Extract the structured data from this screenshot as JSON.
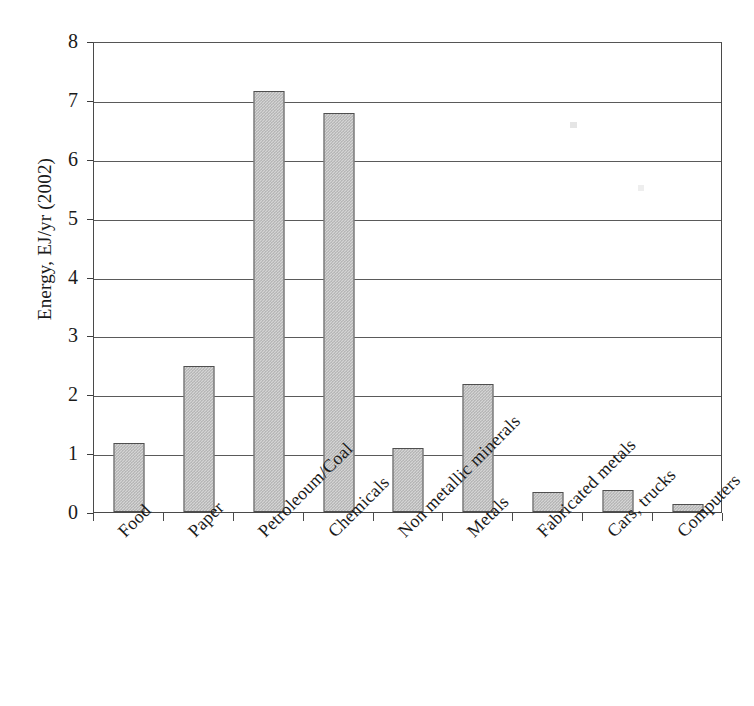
{
  "chart_data": {
    "type": "bar",
    "title": "",
    "subtitle": "",
    "xlabel": "",
    "ylabel": "Energy, EJ/yr (2002)",
    "ylim": [
      0,
      8
    ],
    "ytick_labels": [
      "8",
      "7",
      "6",
      "5",
      "4",
      "3",
      "2",
      "1",
      "0"
    ],
    "ytick_values": [
      8,
      7,
      6,
      5,
      4,
      3,
      2,
      1,
      0
    ],
    "grid": true,
    "grid_axis": "y",
    "legend": null,
    "legend_position": "none",
    "annotations": [],
    "bar_style": {
      "fill": "#d4d4d4",
      "pattern": "fine-checkerboard-stipple",
      "border": "#4f4f4f"
    },
    "categories": [
      "Food",
      "Paper",
      "Petroleoum/Coal",
      "Chemicals",
      "Non metallic minerals",
      "Metals",
      "Fabricated metals",
      "Cars, trucks",
      "Computers"
    ],
    "values": [
      1.17,
      2.48,
      7.15,
      6.78,
      1.08,
      2.18,
      0.34,
      0.38,
      0.14
    ],
    "units": "EJ/yr"
  },
  "axes": {
    "y_title": "Energy, EJ/yr (2002)"
  }
}
